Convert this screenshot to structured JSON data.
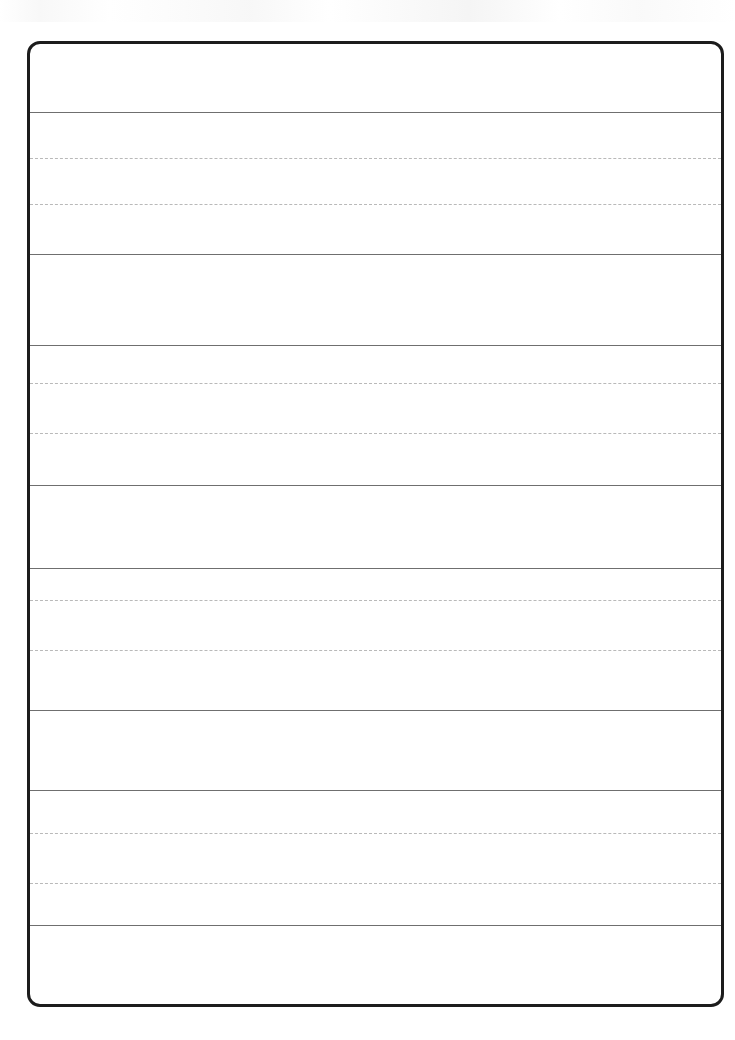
{
  "page": {
    "title": "Blank Lined Handwriting Practice Sheet",
    "width": 735,
    "height": 1040,
    "background_color": "#ffffff",
    "paper_color": "#ffffff"
  },
  "frame": {
    "name": "worksheet-border",
    "left": 27,
    "top": 41,
    "width": 697,
    "height": 966,
    "border_color": "#1c1c1c",
    "border_width": 3,
    "corner_radius": 13
  },
  "ruling": {
    "solid_color": "#6f6f6f",
    "dotted_color": "#b9b9b9",
    "solid_width": 1,
    "dotted_width": 1,
    "dash_pattern": "3px dash, 2px gap"
  },
  "rules": [
    {
      "id": "rule-1",
      "type": "solid",
      "y": 112
    },
    {
      "id": "rule-2",
      "type": "dotted",
      "y": 158
    },
    {
      "id": "rule-3",
      "type": "dotted",
      "y": 204
    },
    {
      "id": "rule-4",
      "type": "solid",
      "y": 254
    },
    {
      "id": "rule-5",
      "type": "solid",
      "y": 345
    },
    {
      "id": "rule-6",
      "type": "dotted",
      "y": 383
    },
    {
      "id": "rule-7",
      "type": "dotted",
      "y": 433
    },
    {
      "id": "rule-8",
      "type": "solid",
      "y": 485
    },
    {
      "id": "rule-9",
      "type": "solid",
      "y": 568
    },
    {
      "id": "rule-10",
      "type": "dotted",
      "y": 600
    },
    {
      "id": "rule-11",
      "type": "dotted",
      "y": 650
    },
    {
      "id": "rule-12",
      "type": "solid",
      "y": 710
    },
    {
      "id": "rule-13",
      "type": "solid",
      "y": 790
    },
    {
      "id": "rule-14",
      "type": "dotted",
      "y": 833
    },
    {
      "id": "rule-15",
      "type": "dotted",
      "y": 883
    },
    {
      "id": "rule-16",
      "type": "solid",
      "y": 925
    }
  ],
  "bands": [
    {
      "id": "band-header",
      "label": "Header area",
      "kind": "plain",
      "top": 41,
      "height": 71,
      "content": ""
    },
    {
      "id": "band-write-1",
      "label": "Writing line 1",
      "kind": "guided",
      "top": 112,
      "height": 142,
      "content": ""
    },
    {
      "id": "band-plain-1",
      "label": "Blank spacer row 1",
      "kind": "plain",
      "top": 254,
      "height": 91,
      "content": ""
    },
    {
      "id": "band-write-2",
      "label": "Writing line 2",
      "kind": "guided",
      "top": 345,
      "height": 140,
      "content": ""
    },
    {
      "id": "band-plain-2",
      "label": "Blank spacer row 2",
      "kind": "plain",
      "top": 485,
      "height": 83,
      "content": ""
    },
    {
      "id": "band-write-3",
      "label": "Writing line 3",
      "kind": "guided",
      "top": 568,
      "height": 142,
      "content": ""
    },
    {
      "id": "band-plain-3",
      "label": "Blank spacer row 3",
      "kind": "plain",
      "top": 710,
      "height": 80,
      "content": ""
    },
    {
      "id": "band-write-4",
      "label": "Writing line 4",
      "kind": "guided",
      "top": 790,
      "height": 135,
      "content": ""
    },
    {
      "id": "band-plain-4",
      "label": "Blank spacer row 4",
      "kind": "plain",
      "top": 925,
      "height": 82,
      "content": ""
    }
  ],
  "text_content": {
    "note": "",
    "has_visible_text": "false"
  }
}
